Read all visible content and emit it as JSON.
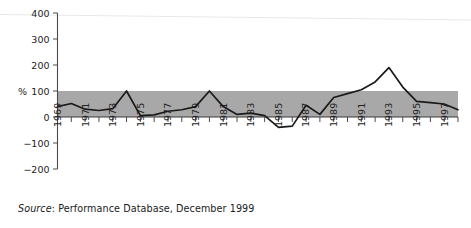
{
  "figure": {
    "source_note_prefix": "Source",
    "source_note_text": ": Performance Database, December 1999",
    "background_color": "#ffffff",
    "band_color": "#a8a8a8",
    "line_color": "#1a1a1a"
  },
  "chart_data": {
    "type": "line",
    "title": "",
    "subtitle": "",
    "xlabel": "",
    "ylabel": "%",
    "ylim": [
      -200,
      400
    ],
    "yticks": [
      -200,
      -100,
      0,
      100,
      200,
      300,
      400
    ],
    "ytick_labels": [
      "−200",
      "−100",
      "0",
      "100",
      "200",
      "300",
      "400"
    ],
    "xlim": [
      1969,
      1998
    ],
    "grid": false,
    "legend": null,
    "shaded_band": {
      "label": "",
      "y_from": 0,
      "y_to": 100,
      "color": "#a8a8a8"
    },
    "zero_reference_line": 0,
    "xtick_labels": [
      "1969",
      "1971",
      "1973",
      "1975",
      "1977",
      "1979",
      "1981",
      "1983",
      "1985",
      "1987",
      "1989",
      "1991",
      "1993",
      "1995",
      "1997"
    ],
    "xtick_label_years": [
      1969,
      1971,
      1973,
      1975,
      1977,
      1979,
      1981,
      1983,
      1985,
      1987,
      1989,
      1991,
      1993,
      1995,
      1997
    ],
    "xticks_all_years": [
      1969,
      1970,
      1971,
      1972,
      1973,
      1974,
      1975,
      1976,
      1977,
      1978,
      1979,
      1980,
      1981,
      1982,
      1983,
      1984,
      1985,
      1986,
      1987,
      1988,
      1989,
      1990,
      1991,
      1992,
      1993,
      1994,
      1995,
      1996,
      1997,
      1998
    ],
    "x": [
      1969,
      1970,
      1971,
      1972,
      1973,
      1974,
      1975,
      1976,
      1977,
      1978,
      1979,
      1980,
      1981,
      1982,
      1983,
      1984,
      1985,
      1986,
      1987,
      1988,
      1989,
      1990,
      1991,
      1992,
      1993,
      1994,
      1995,
      1996,
      1997,
      1998
    ],
    "series": [
      {
        "name": "Performance index",
        "values": [
          40,
          52,
          30,
          25,
          32,
          100,
          5,
          8,
          22,
          28,
          40,
          100,
          40,
          10,
          15,
          5,
          -40,
          -35,
          45,
          10,
          75,
          90,
          105,
          135,
          190,
          115,
          60,
          55,
          50,
          28
        ]
      }
    ]
  }
}
